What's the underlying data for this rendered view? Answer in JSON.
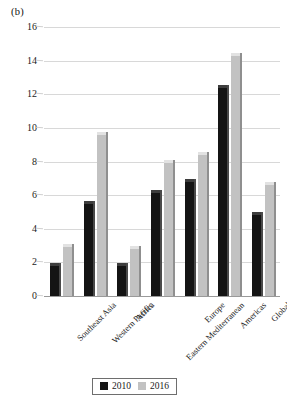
{
  "panel": {
    "label": "(b)"
  },
  "legend": {
    "position": "bottom-center",
    "entries": [
      {
        "key": "2010",
        "label": "2010",
        "color": "#141414",
        "swatch": "black-square-icon"
      },
      {
        "key": "2016",
        "label": "2016",
        "color": "#c2c2c2",
        "swatch": "gray-square-icon"
      }
    ]
  },
  "axis": {
    "y_ticks": [
      "0",
      "2",
      "4",
      "6",
      "8",
      "10",
      "12",
      "14",
      "16"
    ],
    "x_ticks": [
      "Southeast Asia",
      "Western Pacific",
      "Africa",
      "Eastern Mediterranean",
      "Europe",
      "Americas",
      "Global"
    ]
  },
  "chart_data": {
    "type": "bar",
    "title": "(b)",
    "subtitle": "",
    "xlabel": "",
    "ylabel": "",
    "ylim": [
      0,
      16
    ],
    "ytick_step": 2,
    "grid": true,
    "legend_position": "bottom-center",
    "categories": [
      "Southeast Asia",
      "Western Pacific",
      "Africa",
      "Eastern Mediterranean",
      "Europe",
      "Americas",
      "Global"
    ],
    "series": [
      {
        "name": "2010",
        "color": "#141414",
        "values": [
          1.8,
          5.5,
          1.8,
          6.1,
          6.8,
          12.4,
          4.8
        ]
      },
      {
        "name": "2016",
        "color": "#c2c2c2",
        "values": [
          2.9,
          9.6,
          2.8,
          7.9,
          8.4,
          14.3,
          6.6
        ]
      }
    ]
  }
}
